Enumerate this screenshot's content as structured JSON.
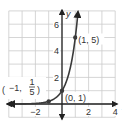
{
  "chart_data": {
    "type": "line",
    "title": "",
    "function": "y = 5^x",
    "xlabel": "x",
    "ylabel": "y",
    "xlim": [
      -4,
      4
    ],
    "ylim": [
      -1,
      7
    ],
    "grid": true,
    "grid_step": 1,
    "x_tick_labels": [
      {
        "value": -2,
        "label": "−2"
      },
      {
        "value": 2,
        "label": "2"
      },
      {
        "value": 4,
        "label": "4"
      }
    ],
    "y_tick_labels": [
      {
        "value": 2,
        "label": "2"
      },
      {
        "value": 4,
        "label": "4"
      },
      {
        "value": 6,
        "label": "6"
      }
    ],
    "series": [
      {
        "name": "y = 5^x",
        "x": [
          -4,
          -3,
          -2,
          -1,
          -0.5,
          0,
          0.5,
          1,
          1.2
        ],
        "y": [
          0.0016,
          0.008,
          0.04,
          0.2,
          0.447,
          1,
          2.236,
          5,
          6.9
        ]
      }
    ],
    "points": [
      {
        "x": -1,
        "y": 0.2,
        "label_main": "−1,",
        "label_num": "1",
        "label_den": "5"
      },
      {
        "x": 0,
        "y": 1,
        "label": "(0, 1)"
      },
      {
        "x": 1,
        "y": 5,
        "label": "(1, 5)"
      }
    ],
    "colors": {
      "curve": "#3a3a3a",
      "axis": "#222222",
      "grid": "#cccccc",
      "point": "#3a3a3a"
    }
  }
}
